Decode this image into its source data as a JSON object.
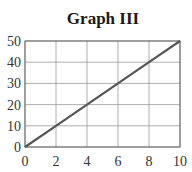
{
  "chart_data": {
    "type": "line",
    "title": "Graph III",
    "xlabel": "",
    "ylabel": "",
    "x": [
      0,
      2,
      4,
      6,
      8,
      10
    ],
    "series": [
      {
        "name": "line",
        "values": [
          0,
          10,
          20,
          30,
          40,
          50
        ]
      }
    ],
    "xlim": [
      0,
      10
    ],
    "ylim": [
      0,
      50
    ],
    "xticks": [
      "0",
      "2",
      "4",
      "6",
      "8",
      "10"
    ],
    "yticks": [
      "0",
      "10",
      "20",
      "30",
      "40",
      "50"
    ],
    "grid": true,
    "legend": null,
    "colors": {
      "line": "#555555",
      "grid": "#999999",
      "axis": "#666666"
    }
  }
}
